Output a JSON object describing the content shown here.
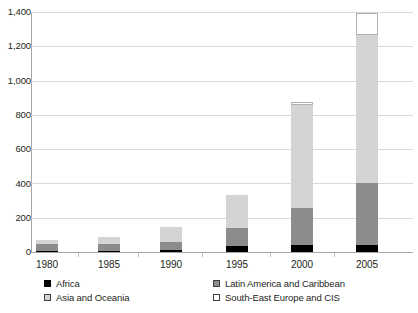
{
  "chart_data": {
    "type": "bar",
    "stacked": true,
    "title": "",
    "xlabel": "",
    "ylabel": "",
    "categories": [
      "1980",
      "1985",
      "1990",
      "1995",
      "2000",
      "2005"
    ],
    "ylim": [
      0,
      1400
    ],
    "yticks": [
      "0",
      "200",
      "400",
      "600",
      "800",
      "1,000",
      "1,200",
      "1,400"
    ],
    "ytick_values": [
      0,
      200,
      400,
      600,
      800,
      1000,
      1200,
      1400
    ],
    "grid": true,
    "legend_position": "bottom",
    "series": [
      {
        "name": "Africa",
        "color": "#000000",
        "values": [
          5,
          5,
          10,
          35,
          40,
          40
        ]
      },
      {
        "name": "Latin America and Caribbean",
        "color": "#8c8c8c",
        "values": [
          40,
          40,
          50,
          105,
          215,
          360
        ]
      },
      {
        "name": "Asia and Oceania",
        "color": "#d4d4d4",
        "values": [
          25,
          40,
          85,
          195,
          600,
          865
        ]
      },
      {
        "name": "South-East Europe and CIS",
        "color": "#ffffff",
        "values": [
          0,
          0,
          0,
          0,
          20,
          130
        ]
      }
    ],
    "totals": [
      70,
      85,
      145,
      335,
      875,
      1395
    ]
  },
  "legend": {
    "items": [
      {
        "label": "Africa",
        "swatch": "africa"
      },
      {
        "label": "Latin America and Caribbean",
        "swatch": "latin"
      },
      {
        "label": "Asia and Oceania",
        "swatch": "asia"
      },
      {
        "label": "South-East Europe and CIS",
        "swatch": "see"
      }
    ]
  }
}
